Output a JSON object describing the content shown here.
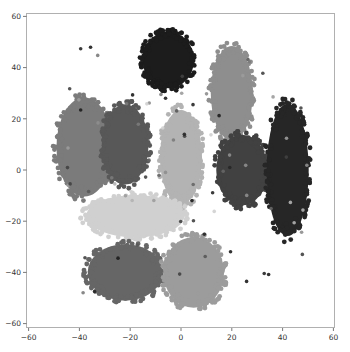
{
  "chart_data": {
    "type": "scatter",
    "title": "",
    "xlabel": "",
    "ylabel": "",
    "xlim": [
      -62,
      60
    ],
    "ylim": [
      -61,
      61
    ],
    "xticks": [
      -60,
      -40,
      -20,
      0,
      20,
      40,
      60
    ],
    "yticks": [
      -60,
      -40,
      -20,
      0,
      20,
      40,
      60
    ],
    "xtick_labels": [
      "−60",
      "−40",
      "−20",
      "0",
      "20",
      "40",
      "60"
    ],
    "ytick_labels": [
      "−60",
      "−40",
      "−20",
      "0",
      "20",
      "40",
      "60"
    ],
    "grid": false,
    "legend": null,
    "series": [
      {
        "name": "cluster-1",
        "color": "#1c1c1c",
        "center": [
          -5,
          43
        ],
        "spread": [
          11,
          12
        ]
      },
      {
        "name": "cluster-2",
        "color": "#8e8e8e",
        "center": [
          20,
          30
        ],
        "spread": [
          9,
          20
        ]
      },
      {
        "name": "cluster-3",
        "color": "#7b7b7b",
        "center": [
          -38,
          9
        ],
        "spread": [
          12,
          21
        ]
      },
      {
        "name": "cluster-4",
        "color": "#585858",
        "center": [
          -22,
          10
        ],
        "spread": [
          10,
          17
        ]
      },
      {
        "name": "cluster-5",
        "color": "#b3b3b3",
        "center": [
          0,
          5
        ],
        "spread": [
          9,
          20
        ]
      },
      {
        "name": "cluster-6",
        "color": "#414141",
        "center": [
          24,
          0
        ],
        "spread": [
          11,
          15
        ]
      },
      {
        "name": "cluster-7",
        "color": "#262626",
        "center": [
          42,
          0
        ],
        "spread": [
          9,
          28
        ]
      },
      {
        "name": "cluster-8",
        "color": "#d0d0d0",
        "center": [
          -18,
          -18
        ],
        "spread": [
          21,
          9
        ]
      },
      {
        "name": "cluster-9",
        "color": "#666666",
        "center": [
          -22,
          -40
        ],
        "spread": [
          16,
          12
        ]
      },
      {
        "name": "cluster-10",
        "color": "#9c9c9c",
        "center": [
          5,
          -40
        ],
        "spread": [
          13,
          15
        ]
      }
    ]
  },
  "axes": {
    "spine_color": "#b0b0b0"
  }
}
